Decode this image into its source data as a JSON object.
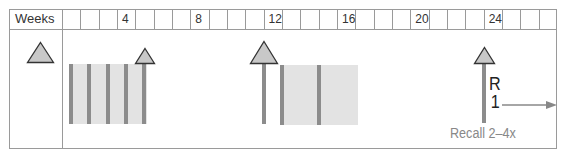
{
  "header": {
    "label": "Weeks",
    "cells": [
      "",
      "",
      "",
      "4",
      "",
      "",
      "",
      "8",
      "",
      "",
      "",
      "12",
      "",
      "",
      "",
      "16",
      "",
      "",
      "",
      "20",
      "",
      "",
      "",
      "24",
      "",
      "",
      ""
    ]
  },
  "markers": {
    "legend_triangle": "triangle-icon",
    "week4_triangle": "triangle-icon",
    "week12_triangle": "triangle-icon",
    "week24_triangle": "triangle-icon"
  },
  "recall_marker": {
    "line1": "R",
    "line2": "1"
  },
  "recall_note": "Recall 2–4x",
  "colors": {
    "border": "#9a9a9a",
    "block_fill": "#e3e3e3",
    "bar": "#8c8c8c",
    "triangle_fill": "#c8c8c8",
    "triangle_stroke": "#333333",
    "note_text": "#888888"
  }
}
